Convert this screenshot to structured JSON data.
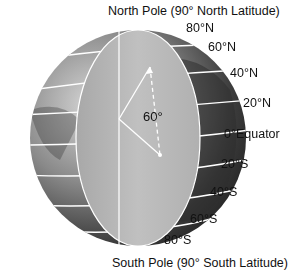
{
  "diagram": {
    "title_top": "North Pole (90° North Latitude)",
    "title_bottom": "South Pole (90° South Latitude)",
    "angle_label": "60°",
    "latitude_labels": [
      {
        "text": "80°N",
        "x": 186,
        "y": 28
      },
      {
        "text": "60°N",
        "x": 208,
        "y": 42
      },
      {
        "text": "40°N",
        "x": 230,
        "y": 67
      },
      {
        "text": "20°N",
        "x": 244,
        "y": 97
      },
      {
        "text": "0°Equator",
        "x": 248,
        "y": 128
      },
      {
        "text": "20°S",
        "x": 240,
        "y": 158
      },
      {
        "text": "40°S",
        "x": 220,
        "y": 188
      },
      {
        "text": "60°S",
        "x": 192,
        "y": 215
      },
      {
        "text": "80°S",
        "x": 164,
        "y": 234
      }
    ],
    "colors": {
      "ocean_dark": "#3a3a3a",
      "land_light": "#9a9a9a",
      "cross_section": "#b5b5b5",
      "lines": "#ffffff"
    }
  }
}
